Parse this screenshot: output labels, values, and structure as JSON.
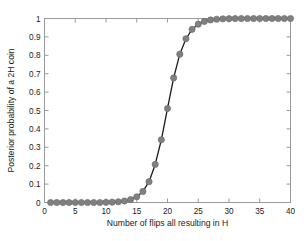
{
  "chart_data": {
    "type": "line",
    "title": "",
    "xlabel": "Number of flips all resulting in H",
    "ylabel": "Posterior probability of a 2H coin",
    "xlim": [
      0,
      40
    ],
    "ylim": [
      0,
      1
    ],
    "xticks": [
      0,
      5,
      10,
      15,
      20,
      25,
      30,
      35,
      40
    ],
    "yticks": [
      0,
      0.1,
      0.2,
      0.3,
      0.4,
      0.5,
      0.6,
      0.7,
      0.8,
      0.9,
      1
    ],
    "xtick_labels": [
      "0",
      "5",
      "10",
      "15",
      "20",
      "25",
      "30",
      "35",
      "40"
    ],
    "ytick_labels": [
      "0",
      "0.1",
      "0.2",
      "0.3",
      "0.4",
      "0.5",
      "0.6",
      "0.7",
      "0.8",
      "0.9",
      "1"
    ],
    "grid": false,
    "legend": false,
    "marker": "circle",
    "marker_color": "#808080",
    "line_color": "#1a1a1a",
    "axes_color": "#9a9a9a",
    "background": "#ffffff",
    "x": [
      1,
      2,
      3,
      4,
      5,
      6,
      7,
      8,
      9,
      10,
      11,
      12,
      13,
      14,
      15,
      16,
      17,
      18,
      19,
      20,
      21,
      22,
      23,
      24,
      25,
      26,
      27,
      28,
      29,
      30,
      31,
      32,
      33,
      34,
      35,
      36,
      37,
      38,
      39,
      40
    ],
    "values": [
      0.0,
      0.0,
      0.0,
      0.0,
      0.0,
      0.0,
      0.0,
      0.0,
      0.0,
      0.001,
      0.002,
      0.004,
      0.008,
      0.016,
      0.031,
      0.06,
      0.113,
      0.207,
      0.341,
      0.511,
      0.677,
      0.806,
      0.89,
      0.941,
      0.969,
      0.984,
      0.992,
      0.996,
      0.998,
      0.999,
      0.9995,
      0.9997,
      0.9999,
      0.9999,
      1.0,
      1.0,
      1.0,
      1.0,
      1.0,
      1.0
    ],
    "series": [
      {
        "name": "Posterior probability of a 2H coin",
        "values": [
          0.0,
          0.0,
          0.0,
          0.0,
          0.0,
          0.0,
          0.0,
          0.0,
          0.0,
          0.001,
          0.002,
          0.004,
          0.008,
          0.016,
          0.031,
          0.06,
          0.113,
          0.207,
          0.341,
          0.511,
          0.677,
          0.806,
          0.89,
          0.941,
          0.969,
          0.984,
          0.992,
          0.996,
          0.998,
          0.999,
          0.9995,
          0.9997,
          0.9999,
          0.9999,
          1.0,
          1.0,
          1.0,
          1.0,
          1.0,
          1.0
        ]
      }
    ]
  }
}
